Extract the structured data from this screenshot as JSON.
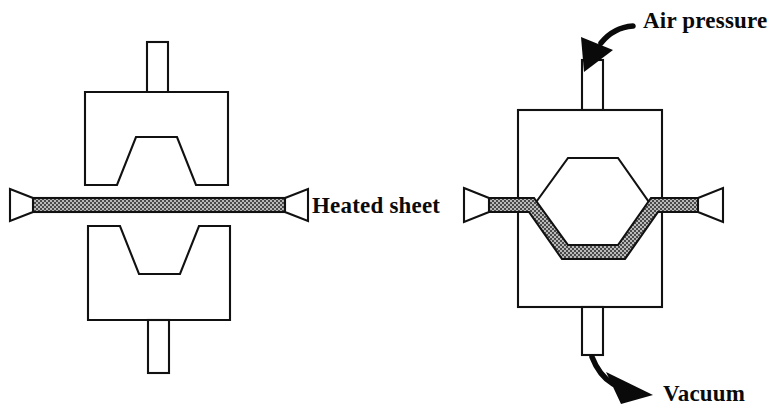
{
  "figure": {
    "background_color": "#ffffff",
    "line_color": "#111111",
    "sheet_fill_color": "#808080",
    "arrow_color": "#0a0a0a",
    "width": 776,
    "height": 416
  },
  "labels": {
    "heated_sheet": "Heated sheet",
    "air_pressure": "Air pressure",
    "vacuum": "Vacuum"
  },
  "panels": [
    {
      "id": "left-panel",
      "name": "open-mold-stage",
      "description": "Open mold with flat heated sheet held between clamps",
      "parts": [
        {
          "name": "upper-mold-block",
          "shape": "block-with-trapezoidal-cavity"
        },
        {
          "name": "upper-mold-tube",
          "shape": "rectangle"
        },
        {
          "name": "lower-mold-block",
          "shape": "block-with-trapezoidal-cavity"
        },
        {
          "name": "lower-mold-tube",
          "shape": "rectangle"
        },
        {
          "name": "heated-sheet",
          "shape": "flat-strip"
        },
        {
          "name": "left-clamp",
          "shape": "trapezoid"
        },
        {
          "name": "right-clamp",
          "shape": "trapezoid"
        }
      ]
    },
    {
      "id": "right-panel",
      "name": "closed-mold-stage",
      "description": "Closed mold with hexagonal cavity, sheet formed into lower cavity half",
      "parts": [
        {
          "name": "mold-body",
          "shape": "rectangle"
        },
        {
          "name": "hexagonal-cavity",
          "shape": "hexagon"
        },
        {
          "name": "air-pressure-tube",
          "shape": "rectangle"
        },
        {
          "name": "vacuum-tube",
          "shape": "rectangle"
        },
        {
          "name": "formed-sheet",
          "shape": "formed-strip"
        },
        {
          "name": "left-clamp",
          "shape": "trapezoid"
        },
        {
          "name": "right-clamp",
          "shape": "trapezoid"
        },
        {
          "name": "air-pressure-arrow",
          "shape": "curved-arrow"
        },
        {
          "name": "vacuum-arrow",
          "shape": "curved-arrow"
        }
      ]
    }
  ]
}
